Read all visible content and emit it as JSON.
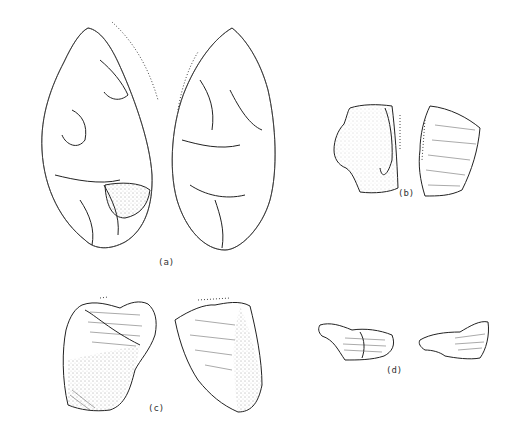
{
  "figure": {
    "type": "archaeological line drawing of lithic artifacts",
    "labels": {
      "a": "(a)",
      "b": "(b)",
      "c": "(c)",
      "d": "(d)"
    },
    "artifacts": [
      {
        "id": "a",
        "description": "bifacial handaxe, two faces"
      },
      {
        "id": "b",
        "description": "flake fragment, two faces"
      },
      {
        "id": "c",
        "description": "cortical flake, two faces"
      },
      {
        "id": "d",
        "description": "small flake, two faces"
      }
    ]
  }
}
